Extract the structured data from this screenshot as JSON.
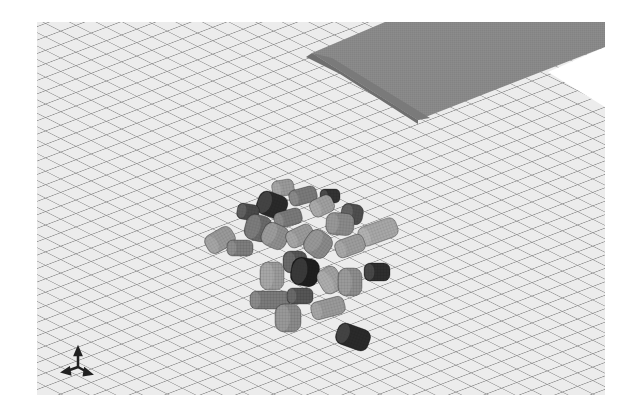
{
  "scene": {
    "description": "3D rendered simulation: pile of meshed cylinders on a gridded floor plane with a tilted slab",
    "background_color": "#ffffff",
    "floor": {
      "bounds": {
        "left": 37,
        "top": 22,
        "right": 605,
        "bottom": 395
      },
      "fill_color": "#ececec",
      "grid_line_color": "#8a8a8a",
      "clip_polygon": [
        [
          37,
          22
        ],
        [
          605,
          22
        ],
        [
          605,
          107
        ],
        [
          550,
          72
        ],
        [
          545,
          72
        ],
        [
          605,
          47
        ],
        [
          605,
          22
        ]
      ]
    },
    "slab": {
      "top_face": [
        [
          385,
          28
        ],
        [
          605,
          28
        ],
        [
          605,
          47
        ],
        [
          418,
          120
        ],
        [
          312,
          53
        ]
      ],
      "front_face": [
        [
          312,
          53
        ],
        [
          418,
          120
        ],
        [
          418,
          124
        ],
        [
          308,
          56
        ]
      ],
      "top_color": "#8c8c8c",
      "front_color": "#6f6f6f"
    },
    "axis_triad": {
      "x": 78,
      "y": 367,
      "color": "#222222"
    },
    "cylinders": [
      {
        "cx": 283,
        "cy": 188,
        "w": 22,
        "h": 16,
        "rot": -10,
        "color": "#9a9a9a"
      },
      {
        "cx": 272,
        "cy": 205,
        "w": 30,
        "h": 24,
        "rot": 20,
        "color": "#2a2a2a"
      },
      {
        "cx": 248,
        "cy": 212,
        "w": 22,
        "h": 16,
        "rot": 10,
        "color": "#4a4a4a"
      },
      {
        "cx": 303,
        "cy": 196,
        "w": 28,
        "h": 16,
        "rot": -15,
        "color": "#7a7a7a"
      },
      {
        "cx": 330,
        "cy": 196,
        "w": 20,
        "h": 14,
        "rot": 0,
        "color": "#333333"
      },
      {
        "cx": 322,
        "cy": 206,
        "w": 24,
        "h": 18,
        "rot": -25,
        "color": "#a0a0a0"
      },
      {
        "cx": 352,
        "cy": 214,
        "w": 22,
        "h": 20,
        "rot": 10,
        "color": "#4f4f4f"
      },
      {
        "cx": 340,
        "cy": 224,
        "w": 28,
        "h": 22,
        "rot": 5,
        "color": "#8a8a8a"
      },
      {
        "cx": 378,
        "cy": 232,
        "w": 40,
        "h": 20,
        "rot": -20,
        "color": "#a8a8a8"
      },
      {
        "cx": 220,
        "cy": 240,
        "w": 30,
        "h": 20,
        "rot": -30,
        "color": "#9a9a9a"
      },
      {
        "cx": 240,
        "cy": 248,
        "w": 26,
        "h": 16,
        "rot": 0,
        "color": "#7d7d7d"
      },
      {
        "cx": 258,
        "cy": 228,
        "w": 26,
        "h": 26,
        "rot": 15,
        "color": "#6a6a6a"
      },
      {
        "cx": 288,
        "cy": 218,
        "w": 28,
        "h": 16,
        "rot": -15,
        "color": "#7a7a7a"
      },
      {
        "cx": 275,
        "cy": 236,
        "w": 26,
        "h": 24,
        "rot": 25,
        "color": "#8f8f8f"
      },
      {
        "cx": 300,
        "cy": 236,
        "w": 28,
        "h": 18,
        "rot": -25,
        "color": "#9b9b9b"
      },
      {
        "cx": 318,
        "cy": 244,
        "w": 26,
        "h": 26,
        "rot": 35,
        "color": "#8a8a8a"
      },
      {
        "cx": 350,
        "cy": 246,
        "w": 30,
        "h": 18,
        "rot": -20,
        "color": "#9d9d9d"
      },
      {
        "cx": 295,
        "cy": 262,
        "w": 24,
        "h": 22,
        "rot": 0,
        "color": "#555555"
      },
      {
        "cx": 305,
        "cy": 272,
        "w": 28,
        "h": 28,
        "rot": 10,
        "color": "#1e1e1e"
      },
      {
        "cx": 272,
        "cy": 276,
        "w": 24,
        "h": 28,
        "rot": 0,
        "color": "#9a9a9a"
      },
      {
        "cx": 330,
        "cy": 280,
        "w": 22,
        "h": 26,
        "rot": -30,
        "color": "#a2a2a2"
      },
      {
        "cx": 350,
        "cy": 282,
        "w": 24,
        "h": 28,
        "rot": 0,
        "color": "#8c8c8c"
      },
      {
        "cx": 377,
        "cy": 272,
        "w": 26,
        "h": 18,
        "rot": 0,
        "color": "#2e2e2e"
      },
      {
        "cx": 270,
        "cy": 300,
        "w": 40,
        "h": 18,
        "rot": 0,
        "color": "#7a7a7a"
      },
      {
        "cx": 300,
        "cy": 296,
        "w": 26,
        "h": 16,
        "rot": 0,
        "color": "#555555"
      },
      {
        "cx": 328,
        "cy": 308,
        "w": 34,
        "h": 18,
        "rot": -15,
        "color": "#9a9a9a"
      },
      {
        "cx": 288,
        "cy": 318,
        "w": 26,
        "h": 28,
        "rot": 0,
        "color": "#8a8a8a"
      },
      {
        "cx": 353,
        "cy": 337,
        "w": 34,
        "h": 22,
        "rot": 20,
        "color": "#2a2a2a"
      }
    ]
  }
}
